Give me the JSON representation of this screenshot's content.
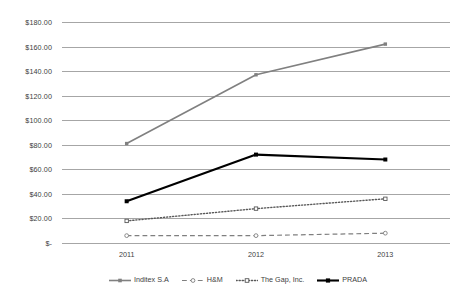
{
  "chart_data": {
    "type": "line",
    "title": "",
    "subtitle": "",
    "xlabel": "",
    "ylabel": "",
    "categories": [
      "2011",
      "2012",
      "2013"
    ],
    "x_tick_labels": [
      "2011",
      "2012",
      "2013"
    ],
    "y_tick_labels": [
      "$180.00",
      "$160.00",
      "$140.00",
      "$120.00",
      "$100.00",
      "$80.00",
      "$60.00",
      "$40.00",
      "$20.00",
      "$-"
    ],
    "y_tick_values": [
      180,
      160,
      140,
      120,
      100,
      80,
      60,
      40,
      20,
      0
    ],
    "ylim": [
      0,
      180
    ],
    "grid": true,
    "grid_axis": "y",
    "legend_position": "bottom",
    "series": [
      {
        "name": "Inditex S.A",
        "values": [
          81,
          137,
          162
        ],
        "color": "#808080",
        "line_style": "solid",
        "line_width": 1.6,
        "marker": "square",
        "legend_icon": "line-solid-gray-marker"
      },
      {
        "name": "H&M",
        "values": [
          6,
          6,
          8
        ],
        "color": "#7f7f7f",
        "line_style": "dashed",
        "line_width": 1.2,
        "marker": "circle-open",
        "legend_icon": "line-dashed-gray-marker"
      },
      {
        "name": "The Gap, Inc.",
        "values": [
          18,
          28,
          36
        ],
        "color": "#595959",
        "line_style": "dotted",
        "line_width": 1.4,
        "marker": "square-open",
        "legend_icon": "line-dotted-gray-marker"
      },
      {
        "name": "PRADA",
        "values": [
          34,
          72,
          68
        ],
        "color": "#000000",
        "line_style": "solid",
        "line_width": 2.1,
        "marker": "square-filled",
        "legend_icon": "line-solid-black-marker"
      }
    ]
  },
  "legend": {
    "items": [
      {
        "label": "Inditex S.A"
      },
      {
        "label": "H&M"
      },
      {
        "label": "The Gap, Inc."
      },
      {
        "label": "PRADA"
      }
    ]
  },
  "colors": {
    "gridline": "#a6a6a6",
    "text": "#404040",
    "background": "#ffffff"
  }
}
